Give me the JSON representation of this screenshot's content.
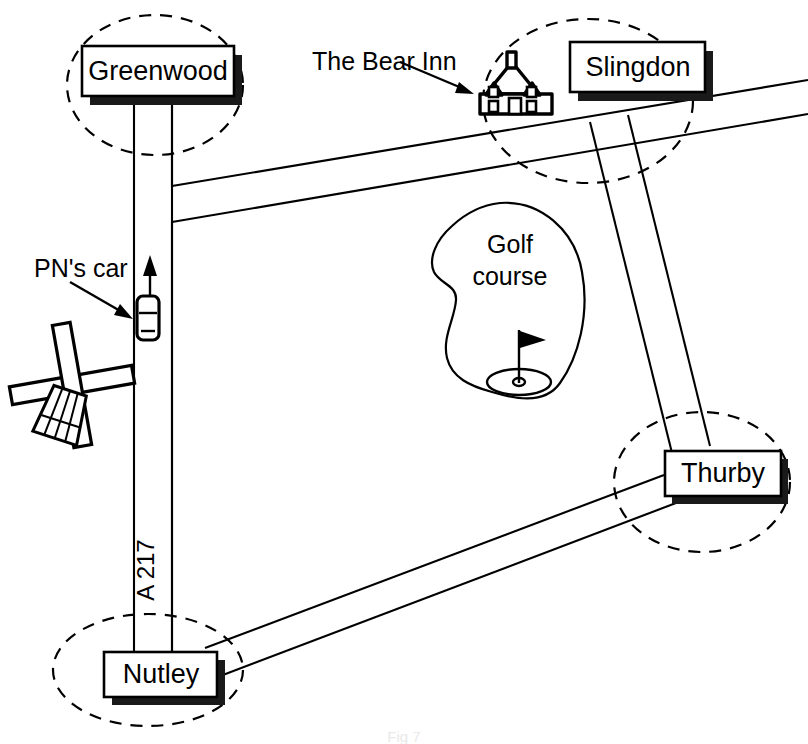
{
  "figure": {
    "type": "schematic road map",
    "caption": "Fig 7"
  },
  "places": [
    {
      "id": "greenwood",
      "label": "Greenwood",
      "kind": "town-sign"
    },
    {
      "id": "slingdon",
      "label": "Slingdon",
      "kind": "town-sign"
    },
    {
      "id": "thurby",
      "label": "Thurby",
      "kind": "town-sign"
    },
    {
      "id": "nutley",
      "label": "Nutley",
      "kind": "town-sign"
    }
  ],
  "annotations": {
    "bear_inn": "The Bear Inn",
    "pns_car": "PN's car",
    "golf_course_line1": "Golf",
    "golf_course_line2": "course",
    "road_label": "A 217"
  },
  "landmarks": [
    {
      "id": "bear-inn-house",
      "name": "house-icon",
      "label": "The Bear Inn"
    },
    {
      "id": "windmill",
      "name": "windmill-icon",
      "label": ""
    },
    {
      "id": "golf-flag",
      "name": "golf-flag-icon",
      "label": ""
    },
    {
      "id": "pn-car",
      "name": "car-icon",
      "label": "PN's car"
    },
    {
      "id": "direction-arrow",
      "name": "direction-arrow-icon",
      "label": ""
    }
  ],
  "colors": {
    "ink": "#000000",
    "paper": "#ffffff",
    "shadow": "#1a1a1a"
  }
}
